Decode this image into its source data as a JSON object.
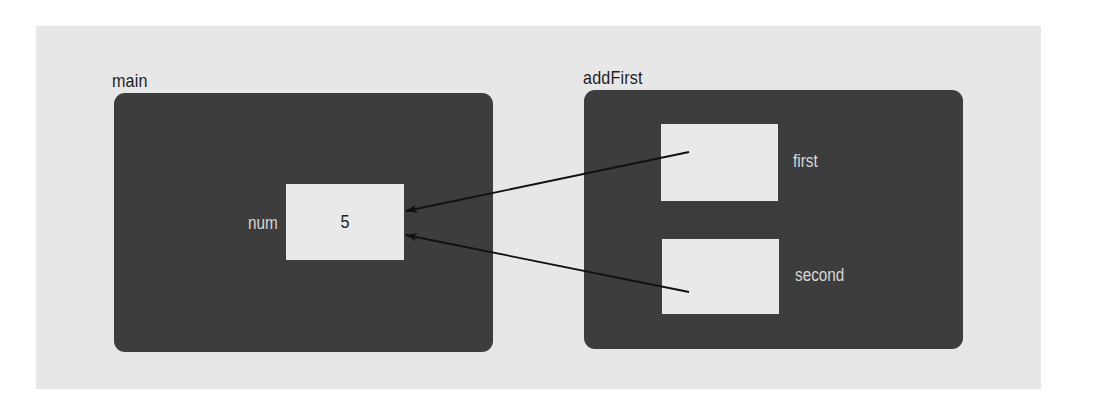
{
  "diagram": {
    "type": "stack-frame memory diagram",
    "colors": {
      "background_panel": "#e7e7e7",
      "frame_fill": "#3d3d3d",
      "cell_fill": "#e9e9e9",
      "frame_label": "#1e1e1e",
      "variable_label": "#d8d8d8",
      "arrow": "#111111"
    },
    "frames": [
      {
        "name": "main",
        "variables": [
          {
            "name": "num",
            "value": "5"
          }
        ]
      },
      {
        "name": "addFirst",
        "variables": [
          {
            "name": "first",
            "value": ""
          },
          {
            "name": "second",
            "value": ""
          }
        ]
      }
    ],
    "arrows": [
      {
        "from": "addFirst.first",
        "to": "main.num"
      },
      {
        "from": "addFirst.second",
        "to": "main.num"
      }
    ]
  }
}
